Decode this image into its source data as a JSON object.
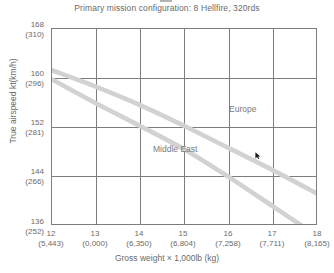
{
  "chart_data": {
    "type": "line",
    "title": "Primary mission configuration: 8 Hellfire, 320rds",
    "xlabel": "Gross weight × 1,000lb (kg)",
    "ylabel": "True airspeed kt(km/h)",
    "xlim": [
      12,
      18
    ],
    "ylim": [
      136,
      168
    ],
    "grid": true,
    "legend_position": "inline-annotation",
    "x_ticks": [
      {
        "primary": "12",
        "secondary": "(5,443)"
      },
      {
        "primary": "13",
        "secondary": "(0,000)"
      },
      {
        "primary": "14",
        "secondary": "(6,350)"
      },
      {
        "primary": "15",
        "secondary": "(6,804)"
      },
      {
        "primary": "16",
        "secondary": "(7,258)"
      },
      {
        "primary": "17",
        "secondary": "(7,711)"
      },
      {
        "primary": "18",
        "secondary": "(8,165)"
      }
    ],
    "y_ticks": [
      {
        "primary": "168",
        "secondary": "(310)"
      },
      {
        "primary": "160",
        "secondary": "(296)"
      },
      {
        "primary": "152",
        "secondary": "(281)"
      },
      {
        "primary": "144",
        "secondary": "(266)"
      },
      {
        "primary": "136",
        "secondary": "(252)"
      }
    ],
    "x": [
      12,
      13,
      14,
      15,
      16,
      17,
      18
    ],
    "series": [
      {
        "name": "Europe",
        "label": "Europe",
        "color": "#d2d2d2",
        "values": [
          161.3,
          158.6,
          155.6,
          152.2,
          148.6,
          145.0,
          141.2
        ]
      },
      {
        "name": "Middle East",
        "label": "Middle East",
        "color": "#d2d2d2",
        "values": [
          159.8,
          155.9,
          152.2,
          148.4,
          143.9,
          139.1,
          134.3
        ]
      }
    ],
    "annotations": [
      {
        "text": "Europe",
        "x": 16.0,
        "y": 150.5
      },
      {
        "text": "Middle East",
        "x": 14.3,
        "y": 146.0
      }
    ]
  },
  "cursor": {
    "name": "mouse-pointer",
    "x": 255,
    "y": 152
  },
  "colors": {
    "grid": "#7d7d7d",
    "curve": "#d2d2d2",
    "text": "#6b6b6b",
    "background": "#ffffff"
  }
}
